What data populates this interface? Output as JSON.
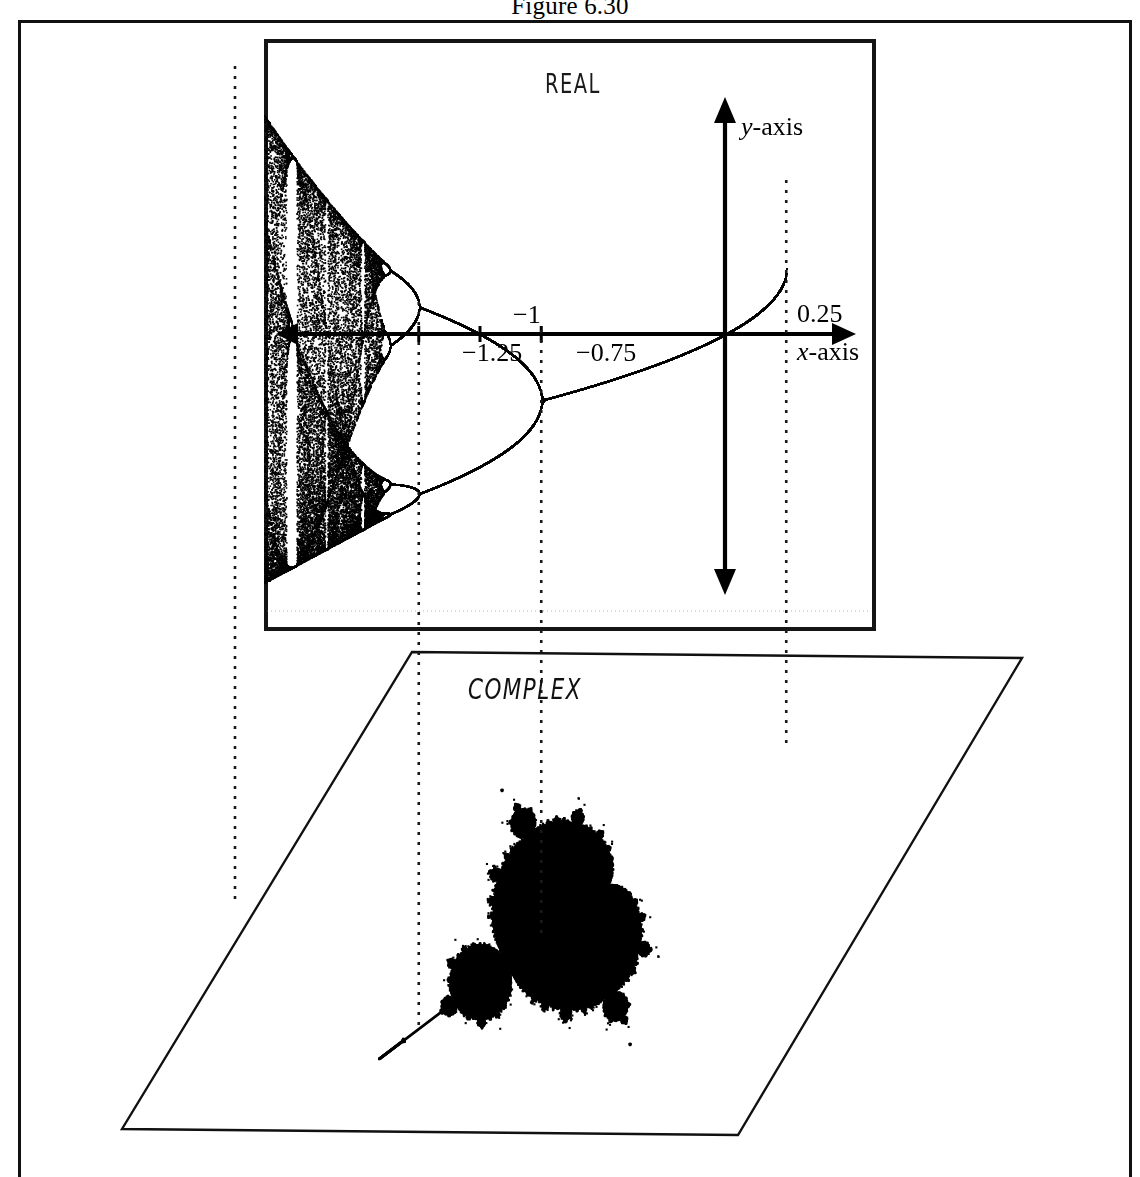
{
  "figure": {
    "caption": "Figure 6.30"
  },
  "panels": {
    "real": {
      "title": "REAL",
      "axes": {
        "x_label": "x-axis",
        "y_label": "y-axis"
      },
      "tick_labels": [
        {
          "text": "−1.25",
          "value": -1.25
        },
        {
          "text": "−1",
          "value": -1.0
        },
        {
          "text": "−0.75",
          "value": -0.75
        },
        {
          "text": "0.25",
          "value": 0.25
        }
      ]
    },
    "complex": {
      "title": "COMPLEX"
    }
  },
  "colors": {
    "ink": "#000000",
    "frame": "#111111",
    "background": "#ffffff",
    "guide": "#1a1a1a"
  },
  "chart_data": [
    {
      "type": "scatter",
      "title": "REAL",
      "description": "Bifurcation (orbit) diagram of the real quadratic map z -> z*z + c, plotting the attracting orbit values y against the parameter x=c.",
      "xlabel": "x-axis",
      "ylabel": "y-axis",
      "xlim": [
        -2.05,
        0.33
      ],
      "ylim": [
        -2.1,
        2.1
      ],
      "grid": false,
      "legend": null,
      "annotations": [
        {
          "text": "−1.25",
          "x": -1.25,
          "note": "period-2 to period-4 bifurcation; vertical dotted guide"
        },
        {
          "text": "−1",
          "x": -1.0,
          "note": "tick on x-axis"
        },
        {
          "text": "−0.75",
          "x": -0.75,
          "note": "period-1 to period-2 bifurcation; vertical dotted guide"
        },
        {
          "text": "0.25",
          "x": 0.25,
          "note": "cusp of main cardioid; vertical dotted guide"
        },
        {
          "text": "",
          "x": -2.0,
          "note": "left edge of chaotic band; vertical dotted guide"
        }
      ],
      "features": {
        "fixed_point_branch_range": [
          -0.75,
          0.25
        ],
        "period_2_range": [
          -1.25,
          -0.75
        ],
        "period_4_range": [
          -1.3680989,
          -1.25
        ],
        "chaos_onset": -1.401155,
        "left_limit": -2.0,
        "period_3_window": [
          -1.7903,
          -1.7489
        ]
      },
      "axis_ticks_x": [
        -1.25,
        -1.0,
        -0.75
      ],
      "dotted_guides_x": [
        -2.0,
        -1.25,
        -0.75,
        0.25
      ]
    },
    {
      "type": "heatmap",
      "title": "COMPLEX",
      "description": "Mandelbrot set for z -> z*z + c drawn in a sheared parallelogram representing the complex c-plane viewed in perspective; the real axis of this plane lines up with the x-axis of the REAL panel above.",
      "xlabel": "",
      "ylabel": "",
      "xlim": [
        -2.05,
        0.55
      ],
      "ylim": [
        -1.25,
        1.25
      ],
      "grid": false,
      "legend": null,
      "annotations": [
        {
          "text": "",
          "x": -2.0,
          "note": "dotted guide from REAL panel"
        },
        {
          "text": "",
          "x": -1.25,
          "note": "dotted guide from REAL panel"
        },
        {
          "text": "",
          "x": -0.75,
          "note": "dotted guide from REAL panel"
        },
        {
          "text": "",
          "x": 0.25,
          "note": "dotted guide from REAL panel"
        }
      ]
    }
  ]
}
